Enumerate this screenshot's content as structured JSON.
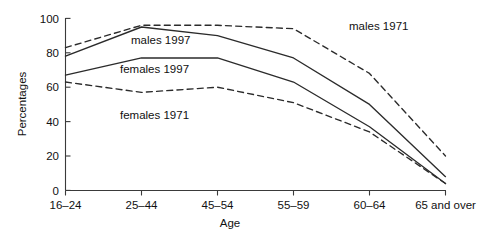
{
  "chart_data": {
    "type": "line",
    "title": "",
    "xlabel": "Age",
    "ylabel": "Percentages",
    "categories": [
      "16–24",
      "25–44",
      "45–54",
      "55–59",
      "60–64",
      "65 and over"
    ],
    "ylim": [
      0,
      100
    ],
    "yticks": [
      0,
      20,
      40,
      60,
      80,
      100
    ],
    "ytick_labels": [
      "0",
      "20",
      "40",
      "60",
      "80",
      "100"
    ],
    "grid": false,
    "legend_position": "inline-annotations",
    "series": [
      {
        "name": "males 1971",
        "style": "dashed",
        "values": [
          83,
          96,
          96,
          94,
          68,
          20
        ]
      },
      {
        "name": "males 1997",
        "style": "solid",
        "values": [
          78,
          95,
          90,
          77,
          50,
          8
        ]
      },
      {
        "name": "females 1997",
        "style": "solid",
        "values": [
          67,
          77,
          77,
          63,
          37,
          4
        ]
      },
      {
        "name": "females 1971",
        "style": "dashed",
        "values": [
          63,
          57,
          60,
          51,
          34,
          4
        ]
      }
    ],
    "annotations": [
      {
        "text": "males 1971",
        "x_category": "60–64",
        "y_value": 92
      },
      {
        "text": "males 1997",
        "x_category": "25–44",
        "y_value": 86
      },
      {
        "text": "females 1997",
        "x_category": "25–44",
        "y_value": 70
      },
      {
        "text": "females 1971",
        "x_category": "25–44",
        "y_value": 48
      }
    ]
  },
  "axes": {
    "y_title": "Percentages",
    "x_title": "Age",
    "y_ticks": [
      "100",
      "80",
      "60",
      "40",
      "20",
      "0"
    ],
    "x_ticks": [
      "16–24",
      "25–44",
      "45–54",
      "55–59",
      "60–64",
      "65 and over"
    ]
  },
  "labels": {
    "males_1971": "males 1971",
    "males_1997": "males 1997",
    "females_1997": "females 1997",
    "females_1971": "females 1971"
  },
  "colors": {
    "line": "#2b2b2b",
    "axis": "#3a3a3a",
    "text": "#111111",
    "background": "#ffffff"
  }
}
